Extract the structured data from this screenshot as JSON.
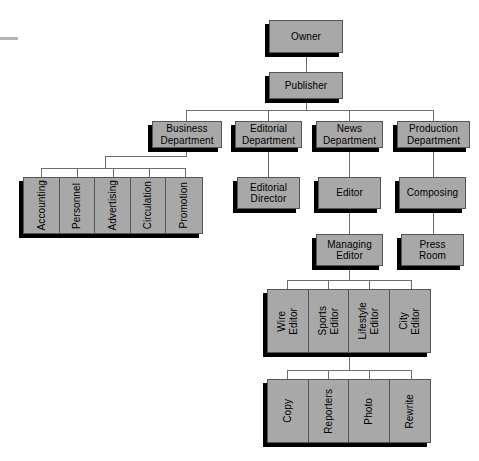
{
  "chart_data": {
    "type": "diagram",
    "diagram_kind": "organizational-hierarchy",
    "colors": {
      "node_fill": "#a8a8a8",
      "node_border": "#555555",
      "shadow": "#000000",
      "connector": "#6e6e6e",
      "background": "#ffffff",
      "text": "#000000"
    }
  },
  "nodes": {
    "owner": "Owner",
    "publisher": "Publisher",
    "business_department": "Business\nDepartment",
    "editorial_department": "Editorial\nDepartment",
    "news_department": "News\nDepartment",
    "production_department": "Production\nDepartment",
    "editorial_director": "Editorial\nDirector",
    "editor": "Editor",
    "composing": "Composing",
    "managing_editor": "Managing\nEditor",
    "press_room": "Press\nRoom"
  },
  "business_units": [
    {
      "label": "Accounting"
    },
    {
      "label": "Personnel"
    },
    {
      "label": "Advertising"
    },
    {
      "label": "Circulation"
    },
    {
      "label": "Promotion"
    }
  ],
  "editor_units": [
    {
      "label": "Wire\nEditor"
    },
    {
      "label": "Sports\nEditor"
    },
    {
      "label": "Lifestyle\nEditor"
    },
    {
      "label": "City\nEditor"
    }
  ],
  "newsroom_units": [
    {
      "label": "Copy"
    },
    {
      "label": "Reporters"
    },
    {
      "label": "Photo"
    },
    {
      "label": "Rewrite"
    }
  ]
}
